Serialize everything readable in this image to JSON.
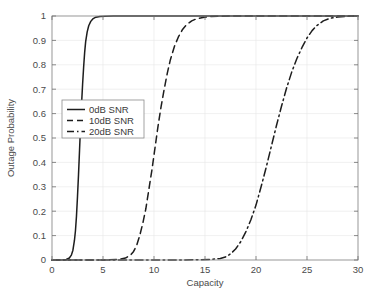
{
  "chart_data": {
    "type": "line",
    "title": "",
    "xlabel": "Capacity",
    "ylabel": "Outage Probability",
    "xlim": [
      0,
      30
    ],
    "ylim": [
      0,
      1
    ],
    "grid": true,
    "legend_position": "center-left",
    "xticks": [
      "0",
      "5",
      "10",
      "15",
      "20",
      "25",
      "30"
    ],
    "xtick_values": [
      0,
      5,
      10,
      15,
      20,
      25,
      30
    ],
    "yticks": [
      "0",
      "0.1",
      "0.2",
      "0.3",
      "0.4",
      "0.5",
      "0.6",
      "0.7",
      "0.8",
      "0.9",
      "1"
    ],
    "ytick_values": [
      0,
      0.1,
      0.2,
      0.3,
      0.4,
      0.5,
      0.6,
      0.7,
      0.8,
      0.9,
      1.0
    ],
    "series": [
      {
        "name": "0dB SNR",
        "style": "solid",
        "color": "#1d1d1d",
        "x": [
          0.0,
          0.5,
          1.0,
          1.4,
          1.7,
          1.9,
          2.05,
          2.2,
          2.3,
          2.4,
          2.5,
          2.6,
          2.7,
          2.8,
          2.9,
          3.0,
          3.1,
          3.2,
          3.3,
          3.45,
          3.6,
          3.8,
          4.0,
          4.3,
          4.7,
          5.2,
          6.0,
          8.0,
          12.0,
          20.0,
          30.0
        ],
        "y": [
          0.0,
          0.0,
          0.0,
          0.002,
          0.008,
          0.02,
          0.04,
          0.08,
          0.12,
          0.18,
          0.26,
          0.35,
          0.45,
          0.55,
          0.64,
          0.72,
          0.79,
          0.85,
          0.895,
          0.935,
          0.96,
          0.978,
          0.988,
          0.995,
          0.998,
          0.999,
          1.0,
          1.0,
          1.0,
          1.0,
          1.0
        ]
      },
      {
        "name": "10dB SNR",
        "style": "dashed",
        "color": "#1d1d1d",
        "x": [
          0.0,
          3.0,
          5.0,
          6.5,
          7.2,
          7.7,
          8.0,
          8.3,
          8.6,
          8.9,
          9.2,
          9.5,
          9.8,
          10.1,
          10.4,
          10.7,
          11.0,
          11.3,
          11.6,
          12.0,
          12.4,
          12.8,
          13.2,
          13.7,
          14.2,
          14.8,
          15.5,
          16.5,
          18.0,
          21.0,
          25.0,
          30.0
        ],
        "y": [
          0.0,
          0.0,
          0.0,
          0.002,
          0.008,
          0.02,
          0.035,
          0.06,
          0.1,
          0.15,
          0.21,
          0.29,
          0.37,
          0.46,
          0.55,
          0.63,
          0.7,
          0.765,
          0.82,
          0.875,
          0.915,
          0.945,
          0.965,
          0.98,
          0.989,
          0.994,
          0.9975,
          0.999,
          1.0,
          1.0,
          1.0,
          1.0
        ]
      },
      {
        "name": "20dB SNR",
        "style": "dashdot",
        "color": "#1d1d1d",
        "x": [
          0.0,
          8.0,
          13.0,
          15.5,
          16.5,
          17.0,
          17.5,
          18.0,
          18.5,
          19.0,
          19.5,
          20.0,
          20.5,
          21.0,
          21.5,
          22.0,
          22.5,
          23.0,
          23.5,
          24.0,
          24.5,
          25.0,
          25.5,
          26.0,
          26.6,
          27.2,
          28.0,
          29.0,
          30.0
        ],
        "y": [
          0.0,
          0.0,
          0.0,
          0.002,
          0.006,
          0.012,
          0.025,
          0.045,
          0.075,
          0.115,
          0.165,
          0.225,
          0.3,
          0.38,
          0.465,
          0.55,
          0.63,
          0.705,
          0.77,
          0.825,
          0.87,
          0.91,
          0.94,
          0.962,
          0.98,
          0.99,
          0.996,
          0.999,
          1.0
        ]
      }
    ],
    "legend_entries": [
      "0dB SNR",
      "10dB SNR",
      "20dB SNR"
    ]
  }
}
